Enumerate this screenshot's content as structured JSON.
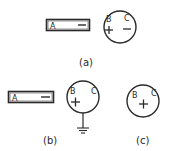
{
  "figure": {
    "panels": [
      {
        "id": "a",
        "caption": "(a)",
        "rod": {
          "label": "A",
          "charge": "—"
        },
        "sphere": {
          "left_label": "B",
          "right_label": "C",
          "left_charge": "+",
          "right_charge": "—"
        },
        "grounded": false
      },
      {
        "id": "b",
        "caption": "(b)",
        "rod": {
          "label": "A",
          "charge": "—"
        },
        "sphere": {
          "left_label": "B",
          "right_label": "C",
          "left_charge": "+",
          "right_charge": ""
        },
        "grounded": true
      },
      {
        "id": "c",
        "caption": "(c)",
        "sphere": {
          "left_label": "B",
          "right_label": "C",
          "center_charge": "+"
        },
        "grounded": false
      }
    ]
  }
}
